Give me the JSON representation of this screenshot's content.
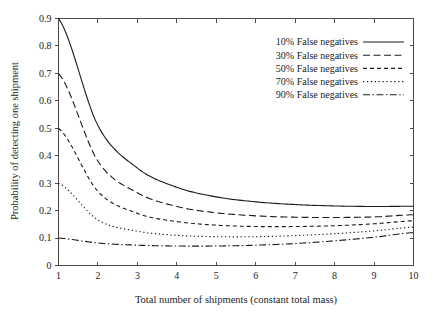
{
  "chart_data": {
    "type": "line",
    "title": "",
    "xlabel": "Total number of shipments (constant total mass)",
    "ylabel": "Probability of detecting one shipment",
    "xlim": [
      1,
      10
    ],
    "ylim": [
      0,
      0.9
    ],
    "grid": false,
    "legend_position": "top-right",
    "xticks": [
      "1",
      "2",
      "3",
      "4",
      "5",
      "6",
      "7",
      "8",
      "9",
      "10"
    ],
    "xtick_values": [
      1,
      2,
      3,
      4,
      5,
      6,
      7,
      8,
      9,
      10
    ],
    "yticks": [
      "0",
      "0.1",
      "0.2",
      "0.3",
      "0.4",
      "0.5",
      "0.6",
      "0.7",
      "0.8",
      "0.9"
    ],
    "ytick_values": [
      0,
      0.1,
      0.2,
      0.3,
      0.4,
      0.5,
      0.6,
      0.7,
      0.8,
      0.9
    ],
    "x": [
      1,
      2,
      3,
      4,
      5,
      6,
      7,
      8,
      9,
      10
    ],
    "series": [
      {
        "name": "10% False negatives",
        "dash": "solid",
        "dasharray": "",
        "values": [
          0.9,
          0.51,
          0.355,
          0.285,
          0.25,
          0.232,
          0.222,
          0.217,
          0.215,
          0.216
        ]
      },
      {
        "name": "30% False negatives",
        "dash": "long-dash",
        "dasharray": "7,3.5",
        "values": [
          0.7,
          0.38,
          0.265,
          0.215,
          0.192,
          0.181,
          0.176,
          0.175,
          0.177,
          0.185
        ]
      },
      {
        "name": "50% False negatives",
        "dash": "medium-dash",
        "dasharray": "4,3",
        "values": [
          0.5,
          0.27,
          0.19,
          0.16,
          0.147,
          0.142,
          0.142,
          0.145,
          0.152,
          0.163
        ]
      },
      {
        "name": "70% False negatives",
        "dash": "dotted",
        "dasharray": "1.3,2.6",
        "values": [
          0.3,
          0.166,
          0.125,
          0.11,
          0.105,
          0.105,
          0.109,
          0.116,
          0.126,
          0.14
        ]
      },
      {
        "name": "90% False negatives",
        "dash": "dash-dot",
        "dasharray": "7,2.5,1.4,2.5",
        "values": [
          0.1,
          0.082,
          0.074,
          0.071,
          0.071,
          0.074,
          0.08,
          0.09,
          0.103,
          0.12
        ]
      }
    ]
  },
  "legend": {
    "entries": [
      "10% False negatives",
      "30% False negatives",
      "50% False negatives",
      "70% False negatives",
      "90% False negatives"
    ]
  },
  "colors": {
    "curve": "#1c1c1c",
    "axis": "#4a4a4a",
    "background": "#ffffff"
  }
}
